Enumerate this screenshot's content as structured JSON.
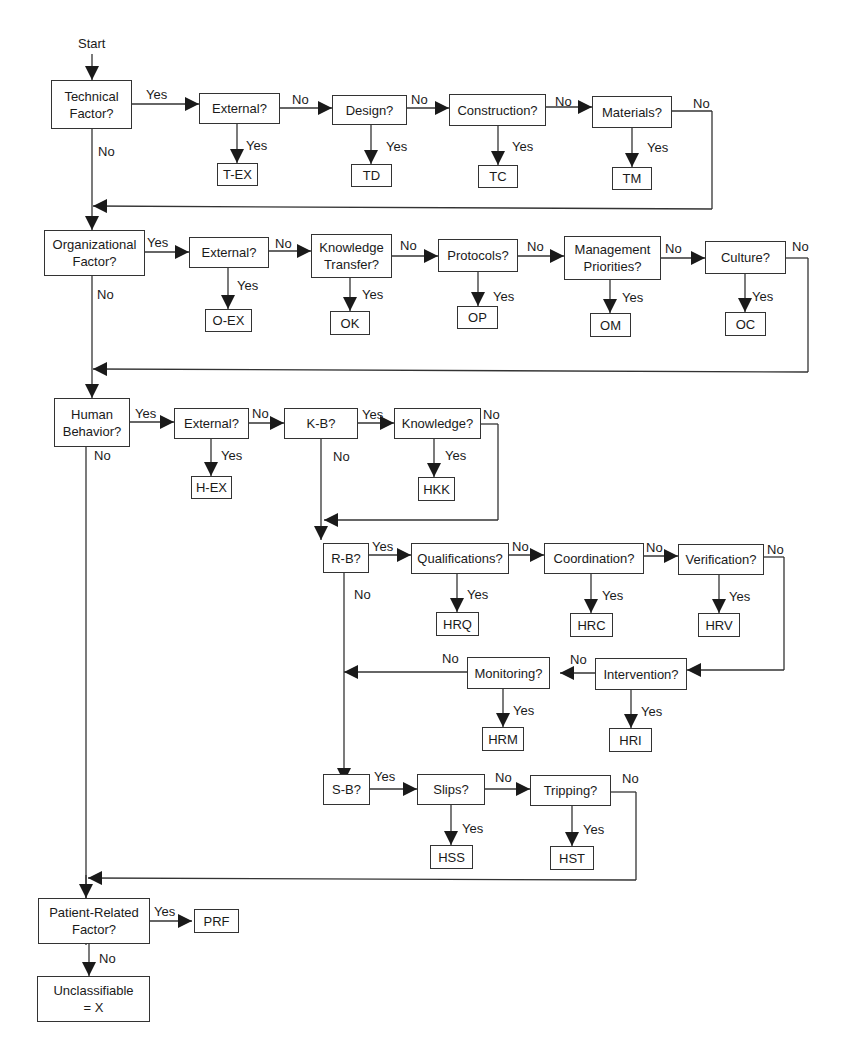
{
  "start_label": "Start",
  "yes": "Yes",
  "no": "No",
  "nodes": {
    "technical": "Technical\nFactor?",
    "t_external": "External?",
    "t_design": "Design?",
    "t_construction": "Construction?",
    "t_materials": "Materials?",
    "t_ex": "T-EX",
    "td": "TD",
    "tc": "TC",
    "tm": "TM",
    "organizational": "Organizational\nFactor?",
    "o_external": "External?",
    "o_knowledge": "Knowledge\nTransfer?",
    "o_protocols": "Protocols?",
    "o_management": "Management\nPriorities?",
    "o_culture": "Culture?",
    "o_ex": "O-EX",
    "ok": "OK",
    "op": "OP",
    "om": "OM",
    "oc": "OC",
    "human": "Human\nBehavior?",
    "h_external": "External?",
    "kb": "K-B?",
    "h_knowledge": "Knowledge?",
    "h_ex": "H-EX",
    "hkk": "HKK",
    "rb": "R-B?",
    "qualifications": "Qualifications?",
    "coordination": "Coordination?",
    "verification": "Verification?",
    "hrq": "HRQ",
    "hrc": "HRC",
    "hrv": "HRV",
    "intervention": "Intervention?",
    "monitoring": "Monitoring?",
    "hrm": "HRM",
    "hri": "HRI",
    "sb": "S-B?",
    "slips": "Slips?",
    "tripping": "Tripping?",
    "hss": "HSS",
    "hst": "HST",
    "patient": "Patient-Related\nFactor?",
    "prf": "PRF",
    "unclassifiable": "Unclassifiable\n= X"
  }
}
